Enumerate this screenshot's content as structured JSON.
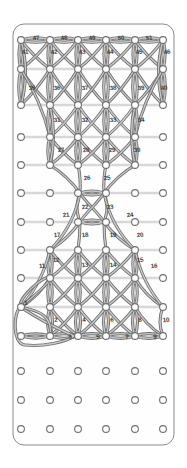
{
  "board": {
    "title": "peg-board-string-art-diagram",
    "background_color": "#ffffff",
    "plate_fill": "#fefefe",
    "plate_stroke": "#8a8a8a",
    "peg_stroke": "#6f6f6f",
    "peg_fill": "#ffffff",
    "cord_color": "#8d8d8d",
    "cord_highlight": "#d8d8d8",
    "label_color": "#3b3b3b",
    "plate": {
      "x": 13,
      "y": 24,
      "width": 161,
      "height": 421,
      "radius": 11
    },
    "peg_radius": 3.4,
    "columns_x": [
      21,
      50,
      78,
      106,
      135,
      163
    ],
    "rows_y": [
      40,
      69,
      105,
      137,
      165,
      193,
      222,
      250,
      278,
      307,
      336,
      371,
      400,
      429
    ]
  },
  "labels": [
    {
      "text": "47",
      "x": 36,
      "y": 38
    },
    {
      "text": "48",
      "x": 64,
      "y": 38
    },
    {
      "text": "49",
      "x": 92,
      "y": 38
    },
    {
      "text": "50",
      "x": 121,
      "y": 38
    },
    {
      "text": "51",
      "x": 149,
      "y": 38
    },
    {
      "text": "41",
      "x": 25,
      "y": 52
    },
    {
      "text": "42",
      "x": 54,
      "y": 52
    },
    {
      "text": "43",
      "x": 82,
      "y": 52
    },
    {
      "text": "44",
      "x": 110,
      "y": 52
    },
    {
      "text": "45",
      "x": 139,
      "y": 52
    },
    {
      "text": "46",
      "x": 167,
      "y": 52
    },
    {
      "text": "35",
      "x": 32,
      "y": 88
    },
    {
      "text": "36",
      "x": 57,
      "y": 88
    },
    {
      "text": "37",
      "x": 85,
      "y": 88
    },
    {
      "text": "38",
      "x": 113,
      "y": 88
    },
    {
      "text": "39",
      "x": 141,
      "y": 88
    },
    {
      "text": "40",
      "x": 164,
      "y": 88
    },
    {
      "text": "31",
      "x": 57,
      "y": 120
    },
    {
      "text": "32",
      "x": 85,
      "y": 120
    },
    {
      "text": "33",
      "x": 113,
      "y": 120
    },
    {
      "text": "34",
      "x": 141,
      "y": 120
    },
    {
      "text": "27",
      "x": 61,
      "y": 150
    },
    {
      "text": "28",
      "x": 86,
      "y": 150
    },
    {
      "text": "29",
      "x": 112,
      "y": 150
    },
    {
      "text": "30",
      "x": 137,
      "y": 150
    },
    {
      "text": "26",
      "x": 87,
      "y": 178
    },
    {
      "text": "25",
      "x": 107,
      "y": 178
    },
    {
      "text": "21",
      "x": 66,
      "y": 215
    },
    {
      "text": "22",
      "x": 85,
      "y": 207
    },
    {
      "text": "23",
      "x": 110,
      "y": 207
    },
    {
      "text": "24",
      "x": 130,
      "y": 215
    },
    {
      "text": "17",
      "x": 57,
      "y": 235
    },
    {
      "text": "18",
      "x": 85,
      "y": 235
    },
    {
      "text": "19",
      "x": 113,
      "y": 235
    },
    {
      "text": "20",
      "x": 140,
      "y": 235
    },
    {
      "text": "11",
      "x": 42,
      "y": 266
    },
    {
      "text": "12",
      "x": 56,
      "y": 260
    },
    {
      "text": "13",
      "x": 85,
      "y": 265
    },
    {
      "text": "14",
      "x": 113,
      "y": 265
    },
    {
      "text": "15",
      "x": 140,
      "y": 260
    },
    {
      "text": "16",
      "x": 154,
      "y": 266
    },
    {
      "text": "1",
      "x": 26,
      "y": 303
    },
    {
      "text": "2",
      "x": 56,
      "y": 320
    },
    {
      "text": "4",
      "x": 84,
      "y": 320
    },
    {
      "text": "6",
      "x": 112,
      "y": 320
    },
    {
      "text": "8",
      "x": 140,
      "y": 320
    },
    {
      "text": "10",
      "x": 166,
      "y": 320
    },
    {
      "text": "3",
      "x": 70,
      "y": 337
    },
    {
      "text": "5",
      "x": 98,
      "y": 337
    },
    {
      "text": "7",
      "x": 127,
      "y": 337
    },
    {
      "text": "9",
      "x": 155,
      "y": 337
    }
  ]
}
